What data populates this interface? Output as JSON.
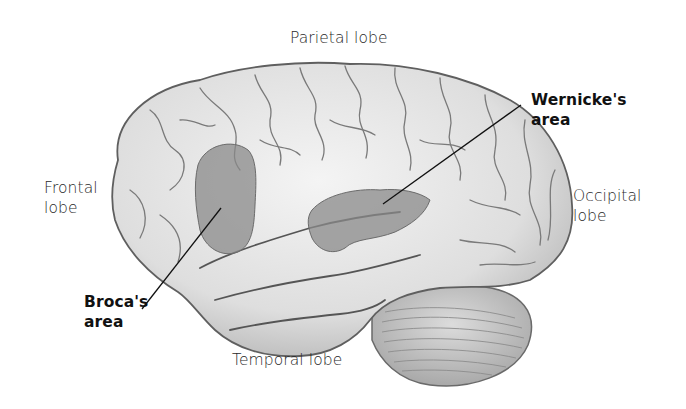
{
  "diagram": {
    "labels": {
      "parietal": "Parietal lobe",
      "frontal_line1": "Frontal",
      "frontal_line2": "lobe",
      "occipital_line1": "Occipital",
      "occipital_line2": "lobe",
      "temporal": "Temporal lobe",
      "wernicke_line1": "Wernicke's",
      "wernicke_line2": "area",
      "broca_line1": "Broca's",
      "broca_line2": "area"
    },
    "highlighted_regions": [
      "Broca's area",
      "Wernicke's area"
    ],
    "colors": {
      "background": "#ffffff",
      "brain_fill": "#e6e6e6",
      "brain_outline": "#6a6a6a",
      "highlight": "#8a8a8a",
      "cerebellum": "#c8c8c8",
      "leader_line": "#111111"
    }
  }
}
